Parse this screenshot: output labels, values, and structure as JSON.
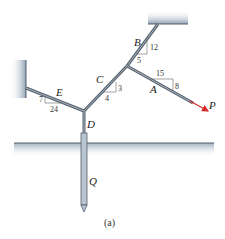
{
  "figure": {
    "caption": "(a)",
    "labels": {
      "A": "A",
      "B": "B",
      "C": "C",
      "D": "D",
      "E": "E",
      "P": "P",
      "Q": "Q"
    },
    "slopes": {
      "B": {
        "rise": "12",
        "run": "5"
      },
      "A": {
        "run": "15",
        "rise": "8"
      },
      "C": {
        "rise": "3",
        "run": "4"
      },
      "E": {
        "rise": "7",
        "run": "24"
      }
    },
    "colors": {
      "cable": "#7a8a99",
      "cable_dark": "#55606b",
      "support": "#8fa0b3",
      "force_arrow": "#d42a2a",
      "ground": "#9eafc0",
      "triangle": "#666666"
    }
  }
}
